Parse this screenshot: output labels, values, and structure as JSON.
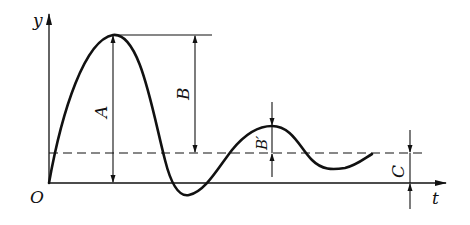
{
  "diagram": {
    "type": "damped-oscillation-response",
    "axes": {
      "y_label": "y",
      "x_label": "t",
      "origin_label": "O"
    },
    "dimensions": {
      "A": "A",
      "B": "B",
      "B_prime": "B′",
      "C": "C"
    },
    "colors": {
      "line": "#111111",
      "background": "#ffffff"
    }
  }
}
